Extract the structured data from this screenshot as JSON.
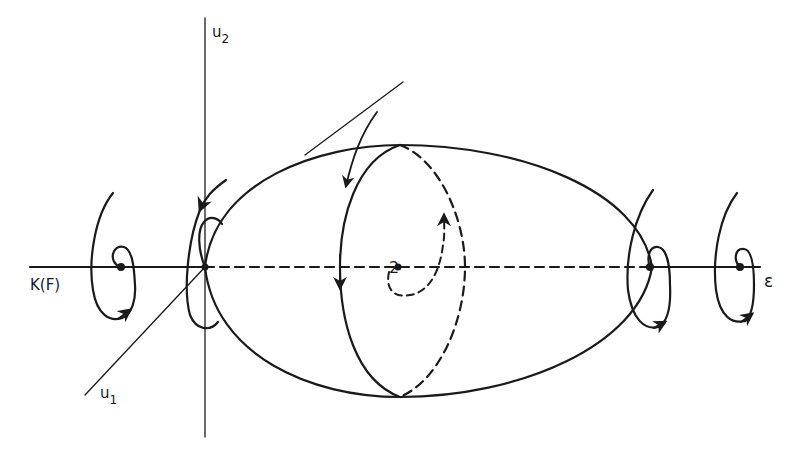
{
  "figure": {
    "type": "phase-space bifurcation diagram",
    "stroke_color": "#1a1a1a",
    "background": "#ffffff"
  },
  "labels": {
    "u2_axis": "u",
    "u2_sub": "2",
    "u1_axis": "u",
    "u1_sub": "1",
    "left_axis": "K(F)",
    "right_axis": "ε",
    "center_point": "2"
  },
  "elements": {
    "horizontal_axis": "K(F) — ε axis, dashed inside the ellipsoid",
    "vertical_axis": "u2 axis",
    "oblique_axis": "u1 axis",
    "ellipsoid": "closed surface with solid front meridian and dashed back meridian",
    "spiral_trajectories": [
      "far-left spiral",
      "left-origin spiral",
      "right-ellipsoid spiral",
      "far-right spiral"
    ],
    "flow_arrows": [
      "incoming arrow from top",
      "downward arrow on front meridian",
      "upward dashed spiral at center"
    ]
  }
}
